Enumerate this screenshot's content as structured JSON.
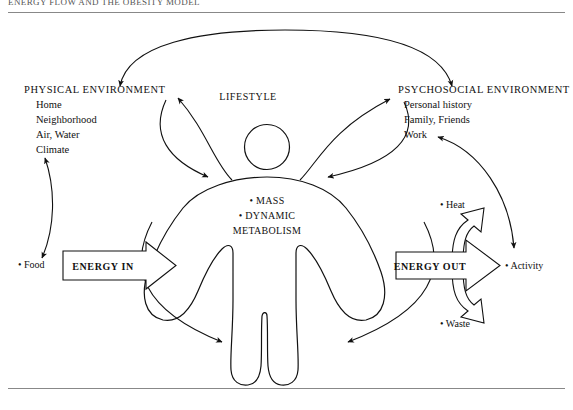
{
  "page": {
    "header_title": "ENERGY FLOW AND THE OBESITY MODEL",
    "figure_domain": "diagram"
  },
  "diagram": {
    "title_center": "LIFESTYLE",
    "left_group": {
      "heading": "PHYSICAL ENVIRONMENT",
      "items": [
        "Home",
        "Neighborhood",
        "Air, Water",
        "Climate"
      ]
    },
    "right_group": {
      "heading": "PSYCHOSOCIAL ENVIRONMENT",
      "items": [
        "Personal history",
        "Family, Friends",
        "Work"
      ]
    },
    "body_core": {
      "items": [
        "MASS",
        "DYNAMIC",
        "METABOLISM"
      ],
      "line1": "•  MASS",
      "line2": "•  DYNAMIC",
      "line3": "METABOLISM"
    },
    "inputs": {
      "food_label": "• Food",
      "energy_in_label": "ENERGY IN"
    },
    "outputs": {
      "energy_out_label": "ENERGY OUT",
      "heat_label": "• Heat",
      "waste_label": "• Waste",
      "activity_label": "• Activity"
    },
    "colors": {
      "ink": "#111111",
      "rule": "#888888",
      "paper": "#ffffff"
    }
  }
}
